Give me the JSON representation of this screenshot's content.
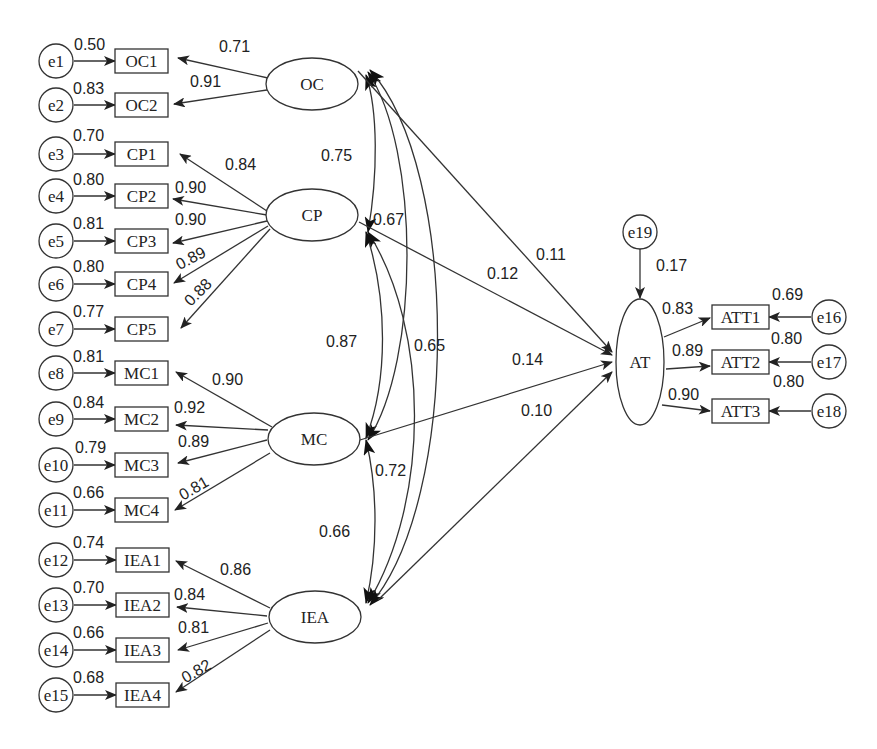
{
  "diagram": {
    "type": "structural-equation-model",
    "latents": [
      {
        "id": "OC",
        "label": "OC"
      },
      {
        "id": "CP",
        "label": "CP"
      },
      {
        "id": "MC",
        "label": "MC"
      },
      {
        "id": "IEA",
        "label": "IEA"
      },
      {
        "id": "AT",
        "label": "AT"
      }
    ],
    "indicators": [
      {
        "label": "OC1",
        "error": "e1",
        "r2": "0.50",
        "loading": "0.71",
        "latent": "OC"
      },
      {
        "label": "OC2",
        "error": "e2",
        "r2": "0.83",
        "loading": "0.91",
        "latent": "OC"
      },
      {
        "label": "CP1",
        "error": "e3",
        "r2": "0.70",
        "loading": "0.84",
        "latent": "CP"
      },
      {
        "label": "CP2",
        "error": "e4",
        "r2": "0.80",
        "loading": "0.90",
        "latent": "CP"
      },
      {
        "label": "CP3",
        "error": "e5",
        "r2": "0.81",
        "loading": "0.90",
        "latent": "CP"
      },
      {
        "label": "CP4",
        "error": "e6",
        "r2": "0.80",
        "loading": "0.89",
        "latent": "CP"
      },
      {
        "label": "CP5",
        "error": "e7",
        "r2": "0.77",
        "loading": "0.88",
        "latent": "CP"
      },
      {
        "label": "MC1",
        "error": "e8",
        "r2": "0.81",
        "loading": "0.90",
        "latent": "MC"
      },
      {
        "label": "MC2",
        "error": "e9",
        "r2": "0.84",
        "loading": "0.92",
        "latent": "MC"
      },
      {
        "label": "MC3",
        "error": "e10",
        "r2": "0.79",
        "loading": "0.89",
        "latent": "MC"
      },
      {
        "label": "MC4",
        "error": "e11",
        "r2": "0.66",
        "loading": "0.81",
        "latent": "MC"
      },
      {
        "label": "IEA1",
        "error": "e12",
        "r2": "0.74",
        "loading": "0.86",
        "latent": "IEA"
      },
      {
        "label": "IEA2",
        "error": "e13",
        "r2": "0.70",
        "loading": "0.84",
        "latent": "IEA"
      },
      {
        "label": "IEA3",
        "error": "e14",
        "r2": "0.66",
        "loading": "0.81",
        "latent": "IEA"
      },
      {
        "label": "IEA4",
        "error": "e15",
        "r2": "0.68",
        "loading": "0.82",
        "latent": "IEA"
      },
      {
        "label": "ATT1",
        "error": "e16",
        "r2": "0.69",
        "loading": "0.83",
        "latent": "AT"
      },
      {
        "label": "ATT2",
        "error": "e17",
        "r2": "0.80",
        "loading": "0.89",
        "latent": "AT"
      },
      {
        "label": "ATT3",
        "error": "e18",
        "r2": "0.80",
        "loading": "0.90",
        "latent": "AT"
      }
    ],
    "structural_error": {
      "label": "e19",
      "r2": "0.17"
    },
    "paths": [
      {
        "from": "OC",
        "to": "AT",
        "value": "0.11"
      },
      {
        "from": "CP",
        "to": "AT",
        "value": "0.12"
      },
      {
        "from": "MC",
        "to": "AT",
        "value": "0.14"
      },
      {
        "from": "IEA",
        "to": "AT",
        "value": "0.10"
      }
    ],
    "correlations": [
      {
        "a": "OC",
        "b": "CP",
        "value": "0.75"
      },
      {
        "a": "CP",
        "b": "MC",
        "value": "0.87"
      },
      {
        "a": "OC",
        "b": "MC",
        "value": "0.67"
      },
      {
        "a": "CP",
        "b": "IEA",
        "value": "0.65"
      },
      {
        "a": "MC",
        "b": "IEA",
        "value": "0.66"
      },
      {
        "a": "OC",
        "b": "IEA",
        "value": "0.72"
      }
    ]
  }
}
